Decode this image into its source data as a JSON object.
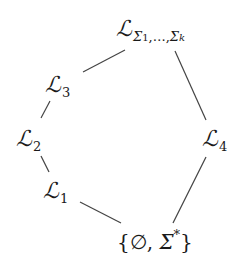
{
  "diagram": {
    "type": "lattice",
    "line_color": "#444444",
    "nodes": {
      "top": {
        "symbol": "ℒ",
        "subscript_sigma1": "Σ",
        "subscript_idx1": "1",
        "subscript_sep": ",…,",
        "subscript_sigmak": "Σ",
        "subscript_idxk": "k"
      },
      "L3": {
        "symbol": "ℒ",
        "subscript": "3"
      },
      "L2": {
        "symbol": "ℒ",
        "subscript": "2"
      },
      "L1": {
        "symbol": "ℒ",
        "subscript": "1"
      },
      "L4": {
        "symbol": "ℒ",
        "subscript": "4"
      },
      "bottom": {
        "open": "{",
        "empty": "∅",
        "comma": ", ",
        "sigma": "Σ",
        "star": "*",
        "close": "}"
      }
    },
    "edges": [
      {
        "from": "top",
        "to": "L3"
      },
      {
        "from": "L3",
        "to": "L2"
      },
      {
        "from": "L2",
        "to": "L1"
      },
      {
        "from": "L1",
        "to": "bottom"
      },
      {
        "from": "top",
        "to": "L4"
      },
      {
        "from": "L4",
        "to": "bottom"
      }
    ]
  }
}
